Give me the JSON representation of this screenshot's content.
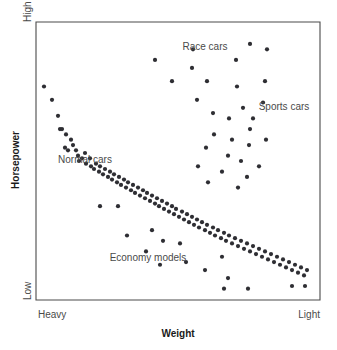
{
  "axes": {
    "x_title": "Weight",
    "y_title": "Horsepower",
    "x_tick_left": "Heavy",
    "x_tick_right": "Light",
    "y_tick_top": "High",
    "y_tick_bottom": "Low"
  },
  "annotations": [
    {
      "name": "race-cars",
      "text": "Race cars",
      "x": 205,
      "y": 50
    },
    {
      "name": "sports-cars",
      "text": "Sports cars",
      "x": 284,
      "y": 110
    },
    {
      "name": "normal-cars",
      "text": "Normal cars",
      "x": 85,
      "y": 163
    },
    {
      "name": "economy-models",
      "text": "Economy models",
      "x": 148,
      "y": 261
    }
  ],
  "style": {
    "dot_color": "#2e2e33",
    "frame_color": "#4a4a4a",
    "text_color": "#4a4a4a",
    "title_color": "#1a1a1a",
    "background": "#ffffff",
    "dot_radius": 2.1
  },
  "plot_area": {
    "left": 36,
    "top": 22,
    "right": 320,
    "bottom": 300
  },
  "chart_data": {
    "type": "scatter",
    "title": "",
    "xlabel": "Weight",
    "ylabel": "Horsepower",
    "xlim": [
      0,
      100
    ],
    "ylim": [
      0,
      100
    ],
    "x_tick_labels": [
      "Heavy",
      "Light"
    ],
    "y_tick_labels": [
      "Low",
      "High"
    ],
    "grid": false,
    "legend": "none",
    "annotations": [
      "Race cars",
      "Sports cars",
      "Normal cars",
      "Economy models"
    ],
    "series": [
      {
        "name": "Normal cars",
        "points": [
          [
            44,
            78
          ],
          [
            52,
            73
          ],
          [
            58,
            67
          ],
          [
            60,
            62
          ],
          [
            62,
            62
          ],
          [
            66,
            60
          ],
          [
            65,
            55
          ],
          [
            68,
            54
          ],
          [
            71,
            58
          ],
          [
            73,
            56
          ],
          [
            76,
            54
          ],
          [
            78,
            52
          ],
          [
            79,
            50
          ],
          [
            82,
            51
          ],
          [
            85,
            53
          ],
          [
            86,
            49
          ],
          [
            90,
            51
          ],
          [
            91,
            48
          ],
          [
            94,
            47
          ],
          [
            96,
            49
          ],
          [
            99,
            46
          ],
          [
            100,
            48
          ],
          [
            103,
            45
          ],
          [
            105,
            47
          ],
          [
            108,
            44
          ],
          [
            110,
            46
          ],
          [
            112,
            43
          ],
          [
            114,
            45
          ],
          [
            117,
            42
          ],
          [
            119,
            44
          ],
          [
            121,
            41
          ],
          [
            124,
            43
          ],
          [
            126,
            40
          ],
          [
            128,
            42
          ],
          [
            131,
            39
          ],
          [
            133,
            41
          ],
          [
            135,
            38
          ],
          [
            138,
            40
          ],
          [
            140,
            37
          ],
          [
            143,
            39
          ],
          [
            145,
            36
          ],
          [
            147,
            38
          ],
          [
            150,
            35
          ],
          [
            152,
            37
          ],
          [
            155,
            34
          ],
          [
            157,
            36
          ],
          [
            159,
            33
          ],
          [
            162,
            35
          ],
          [
            164,
            32
          ],
          [
            167,
            34
          ],
          [
            169,
            31
          ],
          [
            172,
            33
          ],
          [
            174,
            30
          ],
          [
            176,
            32
          ],
          [
            179,
            29
          ],
          [
            182,
            31
          ],
          [
            184,
            28
          ],
          [
            187,
            30
          ],
          [
            189,
            27
          ],
          [
            192,
            29
          ],
          [
            194,
            26
          ],
          [
            197,
            28
          ],
          [
            199,
            25
          ],
          [
            202,
            27
          ],
          [
            205,
            24
          ],
          [
            207,
            26
          ],
          [
            210,
            23
          ],
          [
            213,
            25
          ],
          [
            215,
            22
          ],
          [
            218,
            24
          ],
          [
            221,
            21
          ],
          [
            224,
            23
          ],
          [
            226,
            20
          ],
          [
            229,
            22
          ],
          [
            232,
            19
          ],
          [
            235,
            21
          ],
          [
            238,
            18
          ],
          [
            241,
            20
          ],
          [
            244,
            17
          ],
          [
            247,
            19
          ],
          [
            250,
            16
          ],
          [
            253,
            18
          ],
          [
            256,
            15
          ],
          [
            259,
            17
          ],
          [
            262,
            14
          ],
          [
            265,
            16
          ],
          [
            268,
            13
          ],
          [
            271,
            15
          ],
          [
            274,
            12
          ],
          [
            277,
            14
          ],
          [
            280,
            11
          ],
          [
            283,
            13
          ],
          [
            286,
            10
          ],
          [
            289,
            12
          ],
          [
            292,
            9
          ],
          [
            295,
            11
          ],
          [
            298,
            8
          ],
          [
            301,
            10
          ],
          [
            304,
            7
          ],
          [
            307,
            9
          ]
        ]
      },
      {
        "name": "Race cars",
        "points": [
          [
            155,
            88
          ],
          [
            172,
            80
          ],
          [
            192,
            85
          ],
          [
            207,
            80
          ],
          [
            193,
            92
          ],
          [
            236,
            88
          ],
          [
            237,
            78
          ],
          [
            250,
            94
          ],
          [
            265,
            80
          ],
          [
            267,
            92
          ]
        ]
      },
      {
        "name": "Sports cars",
        "points": [
          [
            213,
            68
          ],
          [
            229,
            66
          ],
          [
            243,
            70
          ],
          [
            250,
            62
          ],
          [
            197,
            73
          ],
          [
            214,
            60
          ],
          [
            232,
            58
          ],
          [
            249,
            56
          ],
          [
            253,
            66
          ],
          [
            263,
            72
          ],
          [
            206,
            55
          ],
          [
            228,
            52
          ],
          [
            241,
            50
          ],
          [
            266,
            58
          ],
          [
            198,
            48
          ],
          [
            222,
            46
          ],
          [
            247,
            44
          ],
          [
            259,
            48
          ],
          [
            208,
            42
          ],
          [
            238,
            40
          ]
        ]
      },
      {
        "name": "Economy models",
        "points": [
          [
            100,
            33
          ],
          [
            118,
            33
          ],
          [
            127,
            22
          ],
          [
            152,
            24
          ],
          [
            146,
            16
          ],
          [
            163,
            20
          ],
          [
            180,
            19
          ],
          [
            160,
            11
          ],
          [
            186,
            12
          ],
          [
            205,
            9
          ],
          [
            222,
            14
          ],
          [
            228,
            6
          ],
          [
            224,
            2
          ],
          [
            248,
            2
          ],
          [
            292,
            3
          ],
          [
            305,
            3
          ]
        ]
      }
    ]
  }
}
